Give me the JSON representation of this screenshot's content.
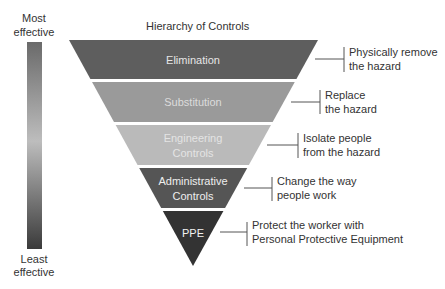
{
  "title": "Hierarchy of Controls",
  "scale": {
    "top_label": [
      "Most",
      "effective"
    ],
    "bottom_label": [
      "Least",
      "effective"
    ],
    "gradient_colors": [
      "#6a6a6a",
      "#bdbdbd",
      "#3a3a3a"
    ]
  },
  "levels": [
    {
      "name": [
        "Elimination"
      ],
      "description": [
        "Physically remove",
        "the hazard"
      ],
      "fill": "#5e5e5e",
      "text_color": "#e6e6e6"
    },
    {
      "name": [
        "Substitution"
      ],
      "description": [
        "Replace",
        "the hazard"
      ],
      "fill": "#9a9a9a",
      "text_color": "#dcdcdc"
    },
    {
      "name": [
        "Engineering",
        "Controls"
      ],
      "description": [
        "Isolate people",
        "from the hazard"
      ],
      "fill": "#bababa",
      "text_color": "#e4e4e4"
    },
    {
      "name": [
        "Administrative",
        "Controls"
      ],
      "description": [
        "Change the way",
        "people work"
      ],
      "fill": "#555555",
      "text_color": "#eeeeee"
    },
    {
      "name": [
        "PPE"
      ],
      "description": [
        "Protect the worker with",
        "Personal Protective Equipment"
      ],
      "fill": "#333333",
      "text_color": "#f2f2f2"
    }
  ]
}
